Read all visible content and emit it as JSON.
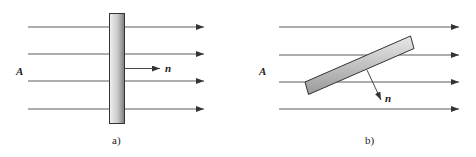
{
  "panels": [
    {
      "caption": "a)",
      "field_label": "A",
      "normal_label": "n",
      "plate_orientation": "perpendicular to field lines",
      "field_lines": 4
    },
    {
      "caption": "b)",
      "field_label": "A",
      "normal_label": "n",
      "plate_orientation": "tilted relative to field lines",
      "field_lines": 4
    }
  ],
  "colors": {
    "line": "#333333",
    "plate_light": "#e6e6e6",
    "plate_dark": "#8a8a8a",
    "plate_border": "#333333"
  }
}
